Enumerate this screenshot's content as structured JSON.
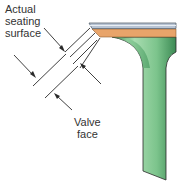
{
  "figure": {
    "type": "valve seating cross-section diagram",
    "labels": {
      "actual_seating_surface": "Actual\nseating\nsurface",
      "valve_face": "Valve\nface"
    },
    "colors": {
      "seat_strip": "#b8c4d4",
      "seat_strip_edge": "#5a6470",
      "face_band": "#e8a46a",
      "valve_stem": "#7cc48c",
      "valve_stem_dark": "#3c8a54",
      "outline": "#2a2a2a",
      "text": "#333333"
    }
  }
}
